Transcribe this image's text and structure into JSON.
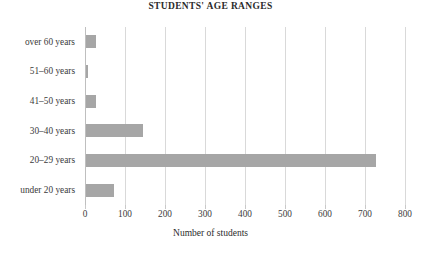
{
  "chart_data": {
    "type": "bar",
    "orientation": "horizontal",
    "title": "STUDENTS' AGE RANGES",
    "xlabel": "Number of students",
    "ylabel": "",
    "categories": [
      "under 20 years",
      "20–29 years",
      "30–40 years",
      "41–50 years",
      "51–60 years",
      "over 60 years"
    ],
    "values": [
      70,
      725,
      143,
      25,
      6,
      25
    ],
    "xlim": [
      0,
      800
    ],
    "xticks": [
      0,
      100,
      200,
      300,
      400,
      500,
      600,
      700,
      800
    ],
    "xtick_labels": [
      "0",
      "100",
      "200",
      "300",
      "400",
      "500",
      "600",
      "700",
      "800"
    ],
    "grid": "vertical",
    "legend": "none",
    "bar_color": "#a6a6a6",
    "gridline_color": "#d9d9d9",
    "axis_color": "#bfbfbf",
    "background": "#ffffff"
  }
}
